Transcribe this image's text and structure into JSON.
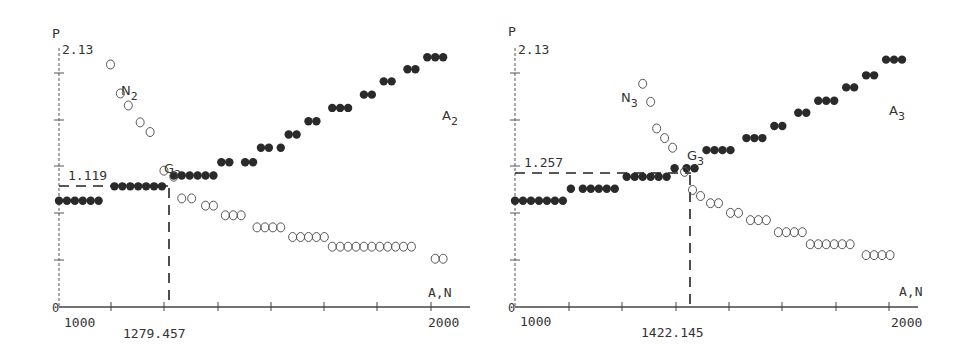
{
  "chart_data": [
    {
      "type": "scatter",
      "title": "",
      "xlabel": "A,N",
      "ylabel": "P",
      "xlim": [
        1000,
        2000
      ],
      "ylim": [
        0,
        2.13
      ],
      "y_max_label": "2.13",
      "x_tick_labels": [
        "1000",
        "2000"
      ],
      "origin_label": "0",
      "grid": false,
      "series": [
        {
          "name": "A2",
          "marker": "filled",
          "label": "A2",
          "x": [
            1000,
            1020,
            1040,
            1060,
            1080,
            1100,
            1140,
            1160,
            1180,
            1200,
            1220,
            1240,
            1260,
            1290,
            1310,
            1330,
            1350,
            1370,
            1390,
            1410,
            1430,
            1470,
            1490,
            1510,
            1530,
            1560,
            1580,
            1600,
            1630,
            1650,
            1690,
            1710,
            1730,
            1770,
            1790,
            1820,
            1840,
            1880,
            1900,
            1930,
            1950,
            1970
          ],
          "y": [
            0.88,
            0.88,
            0.88,
            0.88,
            0.88,
            0.88,
            1.0,
            1.0,
            1.0,
            1.0,
            1.0,
            1.0,
            1.0,
            1.09,
            1.09,
            1.09,
            1.09,
            1.09,
            1.09,
            1.2,
            1.2,
            1.2,
            1.2,
            1.32,
            1.32,
            1.32,
            1.43,
            1.43,
            1.54,
            1.54,
            1.65,
            1.65,
            1.65,
            1.76,
            1.76,
            1.87,
            1.87,
            1.97,
            1.97,
            2.07,
            2.07,
            2.07
          ]
        },
        {
          "name": "N2",
          "marker": "open",
          "label": "N2",
          "x": [
            1130,
            1155,
            1175,
            1205,
            1230,
            1265,
            1290,
            1310,
            1335,
            1370,
            1390,
            1420,
            1440,
            1460,
            1500,
            1520,
            1540,
            1560,
            1590,
            1610,
            1630,
            1650,
            1670,
            1690,
            1710,
            1730,
            1750,
            1770,
            1790,
            1810,
            1830,
            1850,
            1870,
            1890,
            1950,
            1970
          ],
          "y": [
            2.01,
            1.77,
            1.67,
            1.53,
            1.45,
            1.13,
            1.08,
            0.9,
            0.9,
            0.84,
            0.84,
            0.76,
            0.76,
            0.76,
            0.66,
            0.66,
            0.66,
            0.66,
            0.58,
            0.58,
            0.58,
            0.58,
            0.58,
            0.5,
            0.5,
            0.5,
            0.5,
            0.5,
            0.5,
            0.5,
            0.5,
            0.5,
            0.5,
            0.5,
            0.4,
            0.4
          ]
        }
      ],
      "intersection": {
        "label": "G2",
        "x": 1279.457,
        "y": 1.119,
        "x_label": "1279.457",
        "y_label": "1.119"
      }
    },
    {
      "type": "scatter",
      "title": "",
      "xlabel": "A,N",
      "ylabel": "P",
      "xlim": [
        1000,
        2000
      ],
      "ylim": [
        0,
        2.13
      ],
      "y_max_label": "2.13",
      "x_tick_labels": [
        "1000",
        "2000"
      ],
      "origin_label": "0",
      "grid": false,
      "series": [
        {
          "name": "A3",
          "marker": "filled",
          "label": "A3",
          "x": [
            1000,
            1020,
            1040,
            1060,
            1080,
            1100,
            1120,
            1140,
            1170,
            1190,
            1210,
            1230,
            1250,
            1280,
            1300,
            1320,
            1340,
            1360,
            1380,
            1400,
            1430,
            1450,
            1480,
            1500,
            1520,
            1540,
            1580,
            1600,
            1620,
            1650,
            1670,
            1710,
            1730,
            1760,
            1780,
            1800,
            1830,
            1850,
            1880,
            1900,
            1930,
            1950,
            1970
          ],
          "y": [
            0.88,
            0.88,
            0.88,
            0.88,
            0.88,
            0.88,
            0.88,
            0.98,
            0.98,
            0.98,
            0.98,
            0.98,
            0.98,
            1.08,
            1.08,
            1.08,
            1.08,
            1.08,
            1.08,
            1.15,
            1.15,
            1.15,
            1.3,
            1.3,
            1.3,
            1.3,
            1.4,
            1.4,
            1.4,
            1.5,
            1.5,
            1.61,
            1.61,
            1.71,
            1.71,
            1.71,
            1.82,
            1.82,
            1.92,
            1.92,
            2.05,
            2.05,
            2.05
          ]
        },
        {
          "name": "N3",
          "marker": "open",
          "label": "N3",
          "x": [
            1320,
            1340,
            1355,
            1375,
            1395,
            1425,
            1445,
            1465,
            1490,
            1510,
            1540,
            1560,
            1590,
            1610,
            1630,
            1660,
            1680,
            1700,
            1720,
            1740,
            1760,
            1780,
            1800,
            1820,
            1840,
            1880,
            1900,
            1920,
            1940
          ],
          "y": [
            1.85,
            1.7,
            1.48,
            1.4,
            1.32,
            1.12,
            0.97,
            0.92,
            0.86,
            0.86,
            0.78,
            0.78,
            0.72,
            0.72,
            0.72,
            0.62,
            0.62,
            0.62,
            0.62,
            0.52,
            0.52,
            0.52,
            0.52,
            0.52,
            0.52,
            0.43,
            0.43,
            0.43,
            0.43
          ]
        }
      ],
      "intersection": {
        "label": "G3",
        "x": 1422.145,
        "y": 1.257,
        "x_label": "1422.145",
        "y_label": "1.257"
      }
    }
  ],
  "charts": [
    {
      "ylabel": "P",
      "ymax": "2.13",
      "xlabel": "A,N",
      "x_min": "1000",
      "x_max": "2000",
      "origin": "0",
      "series_a_label": "A",
      "series_a_sub": "2",
      "series_n_label": "N",
      "series_n_sub": "2",
      "point_label": "G",
      "point_sub": "2",
      "y_value": "1.119",
      "x_value": "1279.457"
    },
    {
      "ylabel": "P",
      "ymax": "2.13",
      "xlabel": "A,N",
      "x_min": "1000",
      "x_max": "2000",
      "origin": "0",
      "series_a_label": "A",
      "series_a_sub": "3",
      "series_n_label": "N",
      "series_n_sub": "3",
      "point_label": "G",
      "point_sub": "3",
      "y_value": "1.257",
      "x_value": "1422.145"
    }
  ],
  "colors": {
    "ink": "#2a2a2a",
    "background": "#ffffff"
  }
}
